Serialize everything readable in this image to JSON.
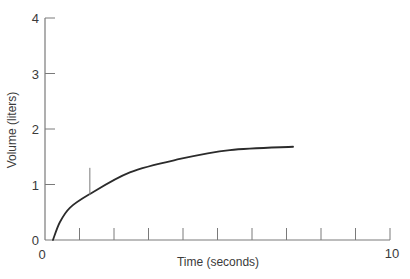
{
  "chart_data": {
    "type": "line",
    "title": "",
    "xlabel": "Time (seconds)",
    "ylabel": "Volume (liters)",
    "xlim": [
      0,
      10
    ],
    "ylim": [
      0,
      4
    ],
    "x_tick_labels": [
      {
        "value": 0,
        "label": "0"
      },
      {
        "value": 10,
        "label": "10"
      }
    ],
    "x_minor_ticks": [
      1,
      2,
      3,
      4,
      5,
      6,
      7,
      8,
      9,
      10
    ],
    "y_tick_labels": [
      {
        "value": 0,
        "label": "0"
      },
      {
        "value": 1,
        "label": "1"
      },
      {
        "value": 2,
        "label": "2"
      },
      {
        "value": 3,
        "label": "3"
      },
      {
        "value": 4,
        "label": "4"
      }
    ],
    "grid": false,
    "legend": null,
    "series": [
      {
        "name": "volume",
        "color": "#2b2b2b",
        "x": [
          0.23,
          0.43,
          0.72,
          1.25,
          2.46,
          3.91,
          5.36,
          7.19
        ],
        "y": [
          0.0,
          0.32,
          0.58,
          0.81,
          1.22,
          1.46,
          1.62,
          1.68
        ]
      }
    ],
    "annotations": [
      {
        "type": "vertical-marker",
        "x": 1.3,
        "y_from": 0.81,
        "y_to": 1.3
      }
    ]
  },
  "labels": {
    "x_axis_title": "Time (seconds)",
    "y_axis_title": "Volume (liters)",
    "x_origin": "0",
    "x_end": "10"
  },
  "colors": {
    "axis": "#7a7a7a",
    "curve": "#2b2b2b",
    "text": "#3a3a3a"
  }
}
